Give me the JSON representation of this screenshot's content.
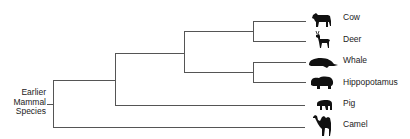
{
  "diagram": {
    "type": "phylogenetic-tree",
    "root_label_lines": [
      "Earlier",
      "Mammal",
      "Species"
    ],
    "line_color": "#555555",
    "icon_color": "#111111",
    "leaves": [
      {
        "label": "Cow",
        "icon": "cow-icon",
        "y": 21
      },
      {
        "label": "Deer",
        "icon": "deer-icon",
        "y": 41
      },
      {
        "label": "Whale",
        "icon": "whale-icon",
        "y": 62
      },
      {
        "label": "Hippopotamus",
        "icon": "hippopotamus-icon",
        "y": 82
      },
      {
        "label": "Pig",
        "icon": "pig-icon",
        "y": 105
      },
      {
        "label": "Camel",
        "icon": "camel-icon",
        "y": 127
      }
    ],
    "clades": [
      {
        "name": "cow-deer",
        "members": [
          "Cow",
          "Deer"
        ]
      },
      {
        "name": "whale-hippopotamus",
        "members": [
          "Whale",
          "Hippopotamus"
        ]
      },
      {
        "name": "ruminant-whippomorph",
        "members": [
          "Cow",
          "Deer",
          "Whale",
          "Hippopotamus"
        ]
      },
      {
        "name": "with-pig",
        "members": [
          "Cow",
          "Deer",
          "Whale",
          "Hippopotamus",
          "Pig"
        ]
      },
      {
        "name": "all",
        "members": [
          "Cow",
          "Deer",
          "Whale",
          "Hippopotamus",
          "Pig",
          "Camel"
        ]
      }
    ]
  }
}
